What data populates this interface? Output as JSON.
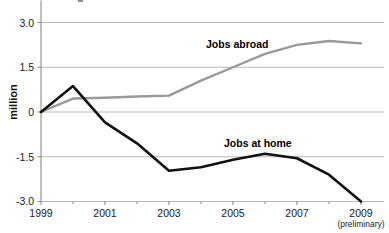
{
  "chart_data": {
    "type": "line",
    "title": "",
    "xlabel": "",
    "ylabel": "million",
    "x": [
      1999,
      2000,
      2001,
      2002,
      2003,
      2004,
      2005,
      2006,
      2007,
      2008,
      2009
    ],
    "xlim": [
      1999,
      2009
    ],
    "ylim": [
      -3.0,
      3.0
    ],
    "y_ticks": [
      "3.0",
      "1.5",
      "0",
      "-1.5",
      "-3.0"
    ],
    "y_tick_values": [
      3.0,
      1.5,
      0,
      -1.5,
      -3.0
    ],
    "x_ticks": [
      "1999",
      "2001",
      "2003",
      "2005",
      "2007",
      "2009"
    ],
    "x_tick_values": [
      1999,
      2001,
      2003,
      2005,
      2007,
      2009
    ],
    "x_minor_ticks": [
      2000,
      2002,
      2004,
      2006,
      2008
    ],
    "x_note": "(preliminary)",
    "x_note_at": 2009,
    "grid": "horizontal",
    "legend": "inline-labels",
    "series": [
      {
        "name": "Jobs abroad",
        "color": "#999999",
        "values": [
          0,
          0.45,
          0.48,
          0.52,
          0.55,
          1.05,
          1.5,
          1.95,
          2.25,
          2.38,
          2.3
        ],
        "label_x": 2006.0,
        "label_y": 2.45
      },
      {
        "name": "Jobs at home",
        "color": "#111111",
        "values": [
          0,
          0.87,
          -0.35,
          -1.05,
          -1.97,
          -1.85,
          -1.6,
          -1.4,
          -1.55,
          -2.1,
          -3.0
        ],
        "label_x": 2006.6,
        "label_y": -0.95
      }
    ]
  },
  "axis": {
    "y_label": "million",
    "y_ticks": [
      "3.0",
      "1.5",
      "0",
      "-1.5",
      "-3.0"
    ],
    "x_ticks": [
      "1999",
      "2001",
      "2003",
      "2005",
      "2007",
      "2009"
    ],
    "x_note": "(preliminary)"
  },
  "labels": {
    "jobs_abroad": "Jobs abroad",
    "jobs_at_home": "Jobs at home"
  },
  "colors": {
    "abroad_line": "#999999",
    "home_line": "#111111",
    "grid": "#b9b9b9",
    "axis": "#8d8d8d",
    "background": "#ffffff"
  }
}
